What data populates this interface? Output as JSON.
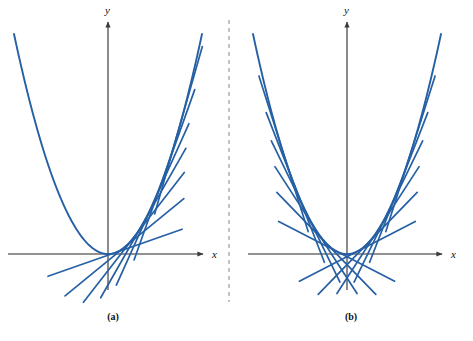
{
  "figure": {
    "background_color": "#ffffff",
    "curve_color": "#2660A4",
    "axis_color": "#6e6e6e",
    "divider_color": "#9a9a9a",
    "text_color": "#111111",
    "panels": [
      {
        "id": "panel-a",
        "caption": "(a)",
        "caption_x": 113,
        "caption_y": 320,
        "origin_x": 108,
        "origin_y": 254,
        "x_axis": {
          "label": "x",
          "label_x": 212,
          "label_y": 258,
          "start_x": 8,
          "end_x": 203,
          "y": 254
        },
        "y_axis": {
          "label": "y",
          "label_x": 105,
          "label_y": 14,
          "x": 108,
          "start_y": 290,
          "end_y": 22
        }
      },
      {
        "id": "panel-b",
        "caption": "(b)",
        "caption_x": 351,
        "caption_y": 320,
        "origin_x": 347,
        "origin_y": 254,
        "x_axis": {
          "label": "x",
          "label_x": 451,
          "label_y": 258,
          "start_x": 248,
          "end_x": 442,
          "y": 254
        },
        "y_axis": {
          "label": "y",
          "label_x": 344,
          "label_y": 14,
          "x": 347,
          "start_y": 290,
          "end_y": 22
        }
      }
    ],
    "divider": {
      "x": 229,
      "y_top": 20,
      "y_bottom": 302,
      "dash": "4 4"
    }
  },
  "chart_data": {
    "type": "line",
    "title": "",
    "xlabel": "x",
    "ylabel": "y",
    "grid": false,
    "legend": false,
    "xlim": [
      -2.2,
      2.2
    ],
    "ylim": [
      -0.6,
      4.2
    ],
    "series": [
      {
        "name": "parabola",
        "panel": "(a)",
        "function": "y = x^2",
        "x": [
          -2.0,
          -1.75,
          -1.5,
          -1.25,
          -1.0,
          -0.75,
          -0.5,
          -0.25,
          0.0,
          0.25,
          0.5,
          0.75,
          1.0,
          1.25,
          1.5,
          1.75,
          2.0
        ],
        "y": [
          4.0,
          3.0625,
          2.25,
          1.5625,
          1.0,
          0.5625,
          0.25,
          0.0625,
          0.0,
          0.0625,
          0.25,
          0.5625,
          1.0,
          1.5625,
          2.25,
          3.0625,
          4.0
        ]
      },
      {
        "name": "parabola",
        "panel": "(b)",
        "function": "y = x^2",
        "x": [
          -2.0,
          -1.75,
          -1.5,
          -1.25,
          -1.0,
          -0.75,
          -0.5,
          -0.25,
          0.0,
          0.25,
          0.5,
          0.75,
          1.0,
          1.25,
          1.5,
          1.75,
          2.0
        ],
        "y": [
          4.0,
          3.0625,
          2.25,
          1.5625,
          1.0,
          0.5625,
          0.25,
          0.0625,
          0.0,
          0.0625,
          0.25,
          0.5625,
          1.0,
          1.5625,
          2.25,
          3.0625,
          4.0
        ]
      }
    ],
    "tangent_lines": [
      {
        "panel": "(a)",
        "tangent_at_x": 0.15,
        "slope": 0.3,
        "half_length": 0.95
      },
      {
        "panel": "(a)",
        "tangent_at_x": 0.35,
        "slope": 0.7,
        "half_length": 0.95
      },
      {
        "panel": "(a)",
        "tangent_at_x": 0.55,
        "slope": 1.1,
        "half_length": 0.95
      },
      {
        "panel": "(a)",
        "tangent_at_x": 0.75,
        "slope": 1.5,
        "half_length": 0.95
      },
      {
        "panel": "(a)",
        "tangent_at_x": 0.95,
        "slope": 1.9,
        "half_length": 0.95
      },
      {
        "panel": "(a)",
        "tangent_at_x": 1.2,
        "slope": 2.4,
        "half_length": 0.95
      },
      {
        "panel": "(a)",
        "tangent_at_x": 1.5,
        "slope": 3.0,
        "half_length": 0.9
      },
      {
        "panel": "(b)",
        "tangent_at_x": -1.35,
        "slope": -2.7,
        "half_length": 0.85
      },
      {
        "panel": "(b)",
        "tangent_at_x": -1.1,
        "slope": -2.2,
        "half_length": 0.85
      },
      {
        "panel": "(b)",
        "tangent_at_x": -0.88,
        "slope": -1.76,
        "half_length": 0.85
      },
      {
        "panel": "(b)",
        "tangent_at_x": -0.66,
        "slope": -1.32,
        "half_length": 0.85
      },
      {
        "panel": "(b)",
        "tangent_at_x": -0.44,
        "slope": -0.88,
        "half_length": 0.85
      },
      {
        "panel": "(b)",
        "tangent_at_x": -0.22,
        "slope": -0.44,
        "half_length": 0.85
      },
      {
        "panel": "(b)",
        "tangent_at_x": 0.22,
        "slope": 0.44,
        "half_length": 0.85
      },
      {
        "panel": "(b)",
        "tangent_at_x": 0.44,
        "slope": 0.88,
        "half_length": 0.85
      },
      {
        "panel": "(b)",
        "tangent_at_x": 0.66,
        "slope": 1.32,
        "half_length": 0.85
      },
      {
        "panel": "(b)",
        "tangent_at_x": 0.88,
        "slope": 1.76,
        "half_length": 0.85
      },
      {
        "panel": "(b)",
        "tangent_at_x": 1.1,
        "slope": 2.2,
        "half_length": 0.85
      },
      {
        "panel": "(b)",
        "tangent_at_x": 1.35,
        "slope": 2.7,
        "half_length": 0.85
      }
    ]
  }
}
